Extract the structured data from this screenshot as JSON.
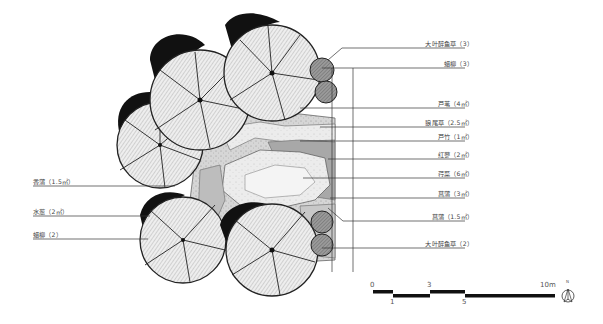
{
  "diagram": {
    "type": "planting plan",
    "labels_right": [
      {
        "text": "大叶醉鱼草（3）",
        "y": 45
      },
      {
        "text": "蜡柳（3）",
        "y": 67
      },
      {
        "text": "芦苇（4㎡）",
        "y": 106
      },
      {
        "text": "狼尾草（2.5㎡）",
        "y": 125
      },
      {
        "text": "芦竹（1㎡）",
        "y": 139
      },
      {
        "text": "红蓼（2㎡）",
        "y": 157
      },
      {
        "text": "荇菜（6㎡）",
        "y": 176
      },
      {
        "text": "菖蒲（3㎡）",
        "y": 196
      },
      {
        "text": "菖蒲（1.5㎡）",
        "y": 219
      },
      {
        "text": "大叶醉鱼草（2）",
        "y": 246
      }
    ],
    "labels_left": [
      {
        "text": "香蒲（1.5㎡）",
        "y": 184
      },
      {
        "text": "水葱（2㎡）",
        "y": 214
      },
      {
        "text": "蜡柳（2）",
        "y": 237
      }
    ],
    "scale_bar": {
      "ticks_top": [
        "0",
        "3",
        "10m"
      ],
      "ticks_bottom": [
        "1",
        "5"
      ]
    },
    "north_arrow": {
      "label": "N",
      "icon": "north-arrow-icon"
    }
  }
}
